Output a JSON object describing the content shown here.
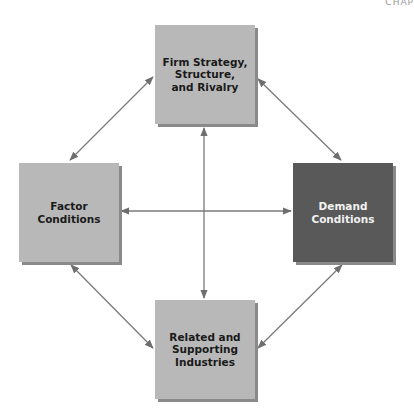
{
  "header": {
    "text": "CHAP"
  },
  "diagram": {
    "title": "",
    "nodes": [
      {
        "id": "firm-strategy",
        "label": "Firm Strategy,\nStructure,\nand Rivalry",
        "position": "top",
        "fill": "#b8b8b8"
      },
      {
        "id": "factor-conditions",
        "label": "Factor\nConditions",
        "position": "left",
        "fill": "#b8b8b8"
      },
      {
        "id": "demand-conditions",
        "label": "Demand\nConditions",
        "position": "right",
        "fill": "#595959"
      },
      {
        "id": "related-supporting",
        "label": "Related and\nSupporting\nIndustries",
        "position": "bottom",
        "fill": "#b8b8b8"
      }
    ],
    "edges": [
      {
        "from": "firm-strategy",
        "to": "factor-conditions",
        "bidirectional": true
      },
      {
        "from": "firm-strategy",
        "to": "demand-conditions",
        "bidirectional": true
      },
      {
        "from": "factor-conditions",
        "to": "related-supporting",
        "bidirectional": true
      },
      {
        "from": "demand-conditions",
        "to": "related-supporting",
        "bidirectional": true
      },
      {
        "from": "firm-strategy",
        "to": "related-supporting",
        "bidirectional": true
      },
      {
        "from": "factor-conditions",
        "to": "demand-conditions",
        "bidirectional": true
      }
    ],
    "colors": {
      "arrow": "#6e6e6e",
      "light_box": "#b8b8b8",
      "dark_box": "#595959"
    }
  }
}
